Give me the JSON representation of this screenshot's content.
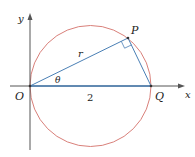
{
  "diagram": {
    "type": "polar-circle-geometry",
    "colors": {
      "axis": "#555555",
      "circle": "#d9807a",
      "segment": "#4a7fb5",
      "text": "#222222"
    },
    "points": {
      "O": {
        "label": "O",
        "x": 30,
        "y": 86
      },
      "Q": {
        "label": "Q",
        "x": 151,
        "y": 86
      },
      "P": {
        "label": "P",
        "x": 128,
        "y": 38
      }
    },
    "circle": {
      "cx": 90.5,
      "cy": 86,
      "r": 60.5
    },
    "labels": {
      "x_axis": "x",
      "y_axis": "y",
      "origin": "O",
      "point_p": "P",
      "point_q": "Q",
      "radius": "r",
      "angle": "θ",
      "diameter": "2"
    }
  }
}
